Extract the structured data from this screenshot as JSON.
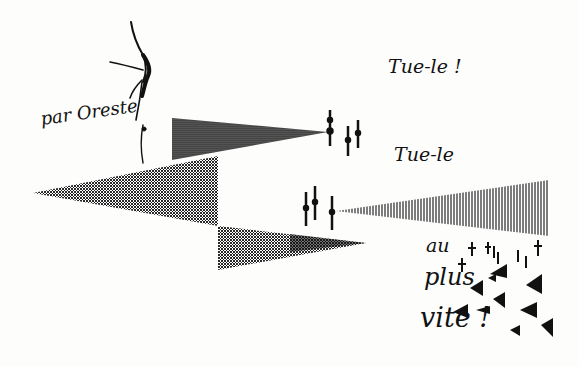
{
  "artwork": {
    "type": "visual poem / calligramme drawing",
    "texts": {
      "oreste": "par Oreste",
      "line1": "Tue-le !",
      "line2": "Tue-le",
      "line3a": "au",
      "line3b": "plus",
      "line3c": "vite !"
    },
    "colors": {
      "ink": "#111111",
      "paper": "#fdfdfc"
    },
    "shapes": [
      "upper-dark-wedge-pointing-right",
      "large-left-wedge-pointing-left",
      "lower-wedge-pointing-right",
      "right-striped-wedge-pointing-left",
      "dagger-bars",
      "scattered-small-triangles",
      "scattered-crosses",
      "dancing-figure"
    ]
  }
}
